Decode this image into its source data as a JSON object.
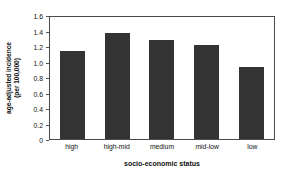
{
  "chart_data": {
    "type": "bar",
    "title": "",
    "categories": [
      "high",
      "high-mid",
      "medium",
      "mid-low",
      "low"
    ],
    "values": [
      1.13,
      1.37,
      1.28,
      1.21,
      0.93
    ],
    "xlabel": "socio-economic status",
    "ylabel": "age-adjusted incidence (per 100,000)",
    "ylabel_line1": "age-adjusted incidence",
    "ylabel_line2": "(per 100,000)",
    "ylim": [
      0,
      1.6
    ],
    "ytick_labels": [
      "1.6",
      "1.4",
      "1.2",
      "1.0",
      "0.8",
      "0.6",
      "0.4",
      "0.2",
      "0"
    ],
    "ytick_values": [
      1.6,
      1.4,
      1.2,
      1.0,
      0.8,
      0.6,
      0.4,
      0.2,
      0
    ],
    "grid": false,
    "legend": false,
    "bar_color": "#333333",
    "frame_color": "#4a4a4a",
    "background": "#ffffff"
  }
}
